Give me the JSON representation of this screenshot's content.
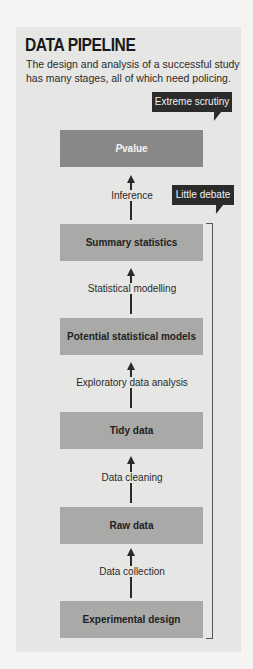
{
  "header": {
    "title": "DATA PIPELINE",
    "subtitle": "The design and analysis of a successful study has many stages, all of which need policing."
  },
  "tags": {
    "extreme": "Extreme scrutiny",
    "little": "Little debate"
  },
  "pvalue": {
    "p": "P",
    "value": " value"
  },
  "stages": [
    {
      "label": "Summary statistics"
    },
    {
      "label": "Potential statistical models"
    },
    {
      "label": "Tidy data"
    },
    {
      "label": "Raw data"
    },
    {
      "label": "Experimental design"
    }
  ],
  "steps": [
    {
      "label": "Inference"
    },
    {
      "label": "Statistical modelling"
    },
    {
      "label": "Exploratory data analysis"
    },
    {
      "label": "Data cleaning"
    },
    {
      "label": "Data collection"
    }
  ],
  "colors": {
    "panel": "#e6e6e4",
    "pvalue_box": "#888886",
    "stage_box": "#a9a9a7",
    "tag": "#2b2b2b"
  }
}
